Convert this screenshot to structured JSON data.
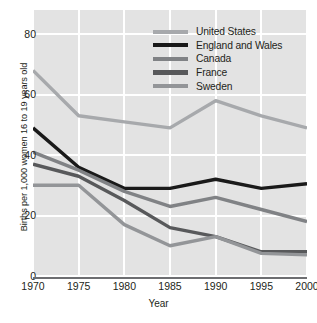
{
  "chart_data": {
    "type": "line",
    "title": "",
    "xlabel": "Year",
    "ylabel": "Births per 1,000 women 16 to 19 years old",
    "x": [
      1970,
      1975,
      1980,
      1985,
      1990,
      1995,
      2000
    ],
    "xticklabels": [
      "1970",
      "1975",
      "1980",
      "1985",
      "1990",
      "1995",
      "2000"
    ],
    "yticklabels": [
      "0",
      "20",
      "40",
      "60",
      "80"
    ],
    "yticks": [
      0,
      20,
      40,
      60,
      80
    ],
    "xlim": [
      1970,
      2000
    ],
    "ylim": [
      0,
      88
    ],
    "grid": true,
    "legend_position": "top-right-inside",
    "plot_background": "#e3e3e3",
    "gridline_color": "#ffffff",
    "axis_color": "#6d6e71",
    "series": [
      {
        "name": "United States",
        "color": "#a7a9ac",
        "values": [
          68,
          53,
          51,
          49,
          58,
          53,
          49
        ]
      },
      {
        "name": "England and Wales",
        "color": "#1a1a1a",
        "values": [
          49,
          36,
          29,
          29,
          32,
          29,
          30.5
        ]
      },
      {
        "name": "Canada",
        "color": "#808285",
        "values": [
          41,
          35,
          28,
          23,
          26,
          22,
          18
        ]
      },
      {
        "name": "France",
        "color": "#58595b",
        "values": [
          37,
          33,
          25,
          16,
          13,
          8,
          8
        ]
      },
      {
        "name": "Sweden",
        "color": "#939598",
        "values": [
          30,
          30,
          17,
          10,
          13,
          7.5,
          7
        ]
      }
    ]
  },
  "legend": {
    "items": [
      {
        "label": "United States"
      },
      {
        "label": "England and Wales"
      },
      {
        "label": "Canada"
      },
      {
        "label": "France"
      },
      {
        "label": "Sweden"
      }
    ]
  }
}
